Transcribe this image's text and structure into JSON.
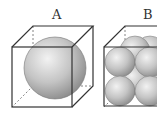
{
  "figure": {
    "panels": [
      {
        "label": "A",
        "description": "cube containing a single large sphere",
        "sphere_count": 1
      },
      {
        "label": "B",
        "description": "cube of the same size packed with eight smaller spheres (2x2x2)",
        "sphere_count": 8
      }
    ]
  },
  "colors": {
    "edge": "#333333",
    "sphere_light": "#f2f2f2",
    "sphere_mid": "#bdbdbd",
    "sphere_dark": "#8a8a8a",
    "background": "#ffffff"
  }
}
